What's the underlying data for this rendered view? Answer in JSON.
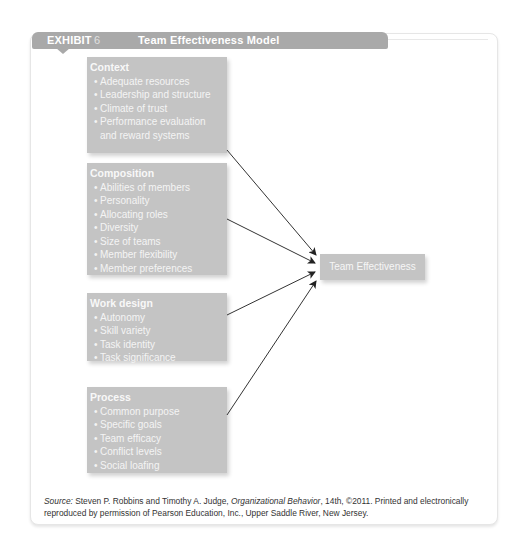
{
  "exhibit": {
    "label": "EXHIBIT",
    "number": "6",
    "title": "Team Effectiveness Model"
  },
  "colors": {
    "header_bg": "#a9a9a9",
    "box_bg": "#c4c4c4",
    "box_text": "#f4f4f4",
    "arrow": "#222222"
  },
  "boxes": [
    {
      "heading": "Context",
      "items": [
        "Adequate resources",
        "Leadership and structure",
        "Climate of trust",
        "Performance evaluation and reward systems"
      ]
    },
    {
      "heading": "Composition",
      "items": [
        "Abilities of members",
        "Personality",
        "Allocating roles",
        "Diversity",
        "Size of teams",
        "Member flexibility",
        "Member preferences"
      ]
    },
    {
      "heading": "Work design",
      "items": [
        "Autonomy",
        "Skill variety",
        "Task identity",
        "Task significance"
      ]
    },
    {
      "heading": "Process",
      "items": [
        "Common purpose",
        "Specific goals",
        "Team efficacy",
        "Conflict levels",
        "Social loafing"
      ]
    }
  ],
  "target": {
    "label": "Team Effectiveness"
  },
  "source": {
    "prefix": "Source:",
    "authors": " Steven P. Robbins and Timothy A. Judge, ",
    "book": "Organizational Behavior",
    "rest": ", 14th, ©2011. Printed and electronically reproduced by permission of Pearson Education, Inc., Upper Saddle River, New Jersey."
  }
}
